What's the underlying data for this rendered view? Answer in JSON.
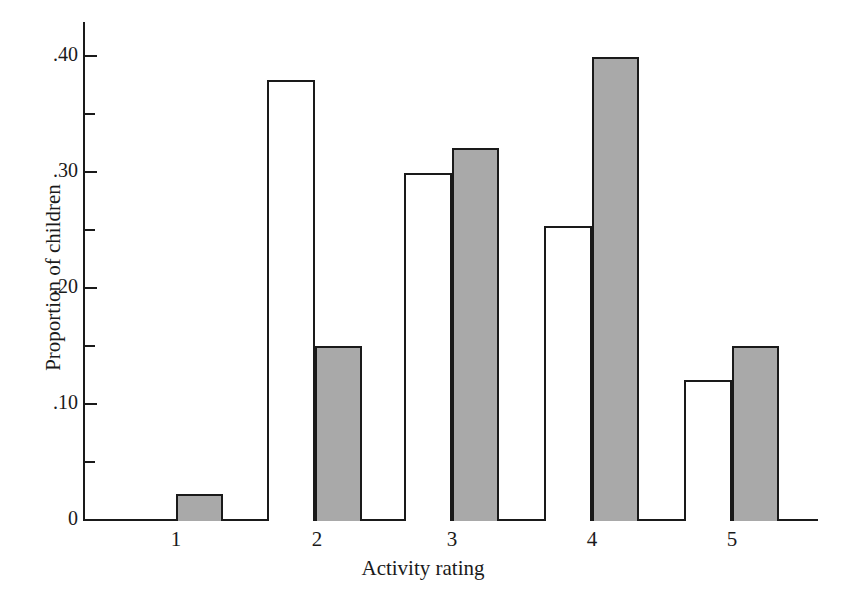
{
  "chart_data": {
    "type": "bar",
    "title": "",
    "xlabel": "Activity rating",
    "ylabel": "Proportion of children",
    "categories": [
      "1",
      "2",
      "3",
      "4",
      "5"
    ],
    "ylim": [
      0,
      0.42
    ],
    "ytick_labels": [
      "0",
      ".10",
      ".20",
      ".30",
      ".40"
    ],
    "ytick_values": [
      0,
      0.1,
      0.2,
      0.3,
      0.4
    ],
    "yminor_tick_values": [
      0.05,
      0.15,
      0.25,
      0.35
    ],
    "grid": false,
    "legend": "none",
    "series": [
      {
        "name": "open",
        "fill": "#ffffff",
        "values": [
          null,
          0.378,
          0.298,
          0.253,
          0.122
        ]
      },
      {
        "name": "shaded",
        "fill": "#a9a9a9",
        "values": [
          0.022,
          0.151,
          0.316,
          0.398,
          0.151
        ]
      }
    ]
  },
  "axis": {
    "y_label": "Proportion of children",
    "x_label": "Activity rating",
    "y_ticks": [
      {
        "label": ".40",
        "top": 55
      },
      {
        "label": "",
        "top": 113
      },
      {
        "label": ".30",
        "top": 171
      },
      {
        "label": "",
        "top": 229
      },
      {
        "label": ".20",
        "top": 287
      },
      {
        "label": "",
        "top": 345
      },
      {
        "label": ".10",
        "top": 403
      },
      {
        "label": "",
        "top": 461
      },
      {
        "label": "0",
        "top": 519
      }
    ],
    "x_ticks": [
      {
        "label": "1",
        "left": 176
      },
      {
        "label": "2",
        "left": 317
      },
      {
        "label": "3",
        "left": 452
      },
      {
        "label": "4",
        "left": 592
      },
      {
        "label": "5",
        "left": 732
      }
    ]
  },
  "bars": [
    {
      "group": "1",
      "series": "shaded",
      "value": 0.022,
      "left": 176,
      "width": 47,
      "top": 494,
      "height": 27
    },
    {
      "group": "2",
      "series": "open",
      "value": 0.378,
      "left": 267,
      "width": 48,
      "top": 80,
      "height": 441
    },
    {
      "group": "2",
      "series": "shaded",
      "value": 0.151,
      "left": 315,
      "width": 47,
      "top": 346,
      "height": 175
    },
    {
      "group": "3",
      "series": "open",
      "value": 0.298,
      "left": 404,
      "width": 48,
      "top": 173,
      "height": 348
    },
    {
      "group": "3",
      "series": "shaded",
      "value": 0.316,
      "left": 452,
      "width": 47,
      "top": 148,
      "height": 373
    },
    {
      "group": "4",
      "series": "open",
      "value": 0.253,
      "left": 544,
      "width": 48,
      "top": 226,
      "height": 295
    },
    {
      "group": "4",
      "series": "shaded",
      "value": 0.398,
      "left": 592,
      "width": 47,
      "top": 57,
      "height": 464
    },
    {
      "group": "5",
      "series": "open",
      "value": 0.122,
      "left": 684,
      "width": 48,
      "top": 380,
      "height": 141
    },
    {
      "group": "5",
      "series": "shaded",
      "value": 0.151,
      "left": 732,
      "width": 47,
      "top": 346,
      "height": 175
    }
  ]
}
